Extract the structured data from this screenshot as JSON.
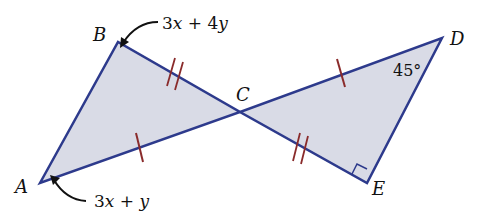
{
  "diagram": {
    "type": "geometry",
    "colors": {
      "fill": "#d9dbe6",
      "stroke": "#2d3a8c",
      "tick": "#8a2b2b"
    },
    "points": {
      "A": {
        "label": "A",
        "x": 40,
        "y": 183
      },
      "B": {
        "label": "B",
        "x": 118,
        "y": 42
      },
      "C": {
        "label": "C",
        "x": 240,
        "y": 112
      },
      "D": {
        "label": "D",
        "x": 442,
        "y": 38
      },
      "E": {
        "label": "E",
        "x": 367,
        "y": 183
      }
    },
    "annotations": {
      "angle_B": {
        "coef1": "3",
        "var1": "x",
        "op": " + ",
        "coef2": "4",
        "var2": "y"
      },
      "angle_A": {
        "coef1": "3",
        "var1": "x",
        "op": " + ",
        "coef2": "",
        "var2": "y"
      },
      "angle_D": "45°",
      "angle_E": "right angle"
    },
    "congruence_marks": {
      "AC_CD": "single tick",
      "BC_CE": "double tick"
    }
  }
}
